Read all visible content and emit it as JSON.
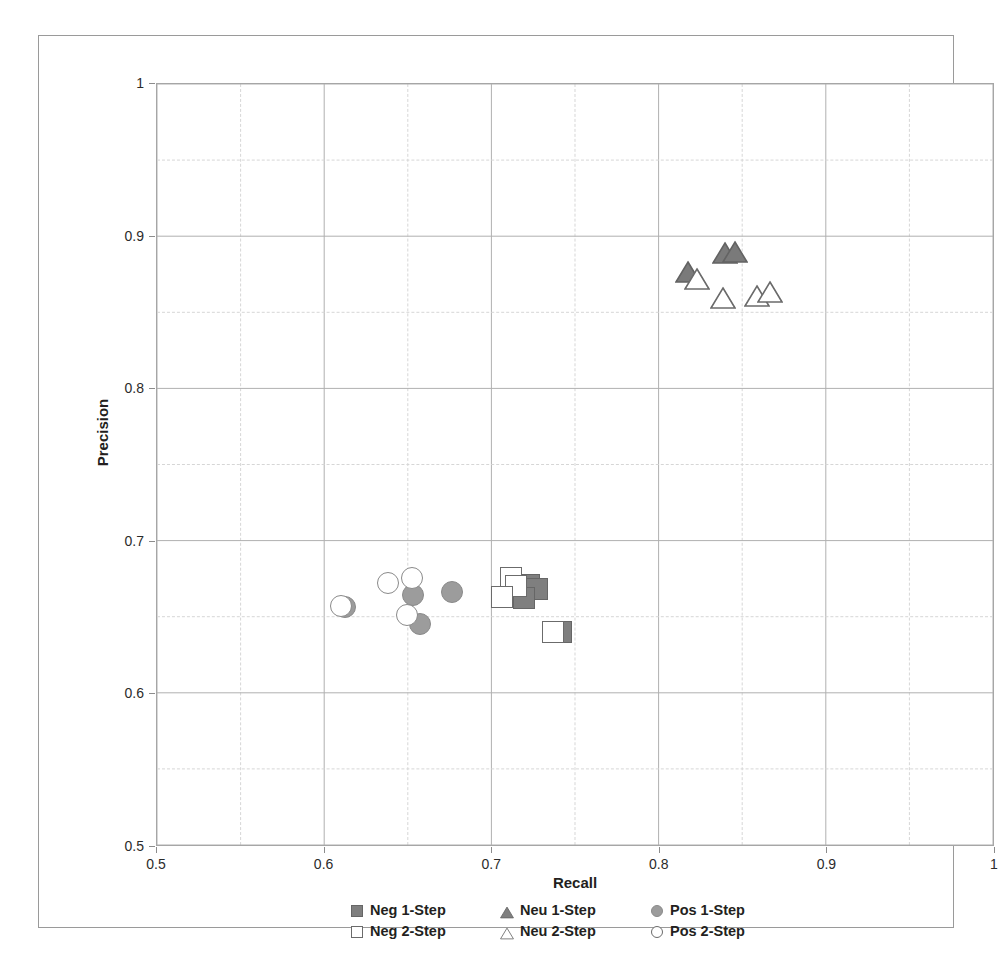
{
  "axes": {
    "x_title": "Recall",
    "y_title": "Precision",
    "x_ticks": [
      "0.5",
      "0.6",
      "0.7",
      "0.8",
      "0.9",
      "1"
    ],
    "y_ticks": [
      "0.5",
      "0.6",
      "0.7",
      "0.8",
      "0.9",
      "1"
    ]
  },
  "legend": {
    "rows": [
      [
        {
          "label": "Neg 1-Step",
          "marker": "square-filled",
          "color": "#7f7f7f"
        },
        {
          "label": "Neu 1-Step",
          "marker": "triangle-filled",
          "color": "#7f7f7f"
        },
        {
          "label": "Pos 1-Step",
          "marker": "circle-filled",
          "color": "#9c9c9c"
        }
      ],
      [
        {
          "label": "Neg 2-Step",
          "marker": "square-hollow",
          "color": "#ffffff"
        },
        {
          "label": "Neu 2-Step",
          "marker": "triangle-hollow",
          "color": "#ffffff"
        },
        {
          "label": "Pos 2-Step",
          "marker": "circle-hollow",
          "color": "#ffffff"
        }
      ]
    ]
  },
  "bleed_text": {
    "line1": "",
    "line2": ""
  },
  "chart_data": {
    "type": "scatter",
    "title": "",
    "xlabel": "Recall",
    "ylabel": "Precision",
    "xlim": [
      0.5,
      1.0
    ],
    "ylim": [
      0.5,
      1.0
    ],
    "xtick_step": 0.1,
    "ytick_step": 0.1,
    "minor_grid_step": 0.05,
    "grid": true,
    "legend_position": "bottom",
    "series": [
      {
        "name": "Neg 1-Step",
        "marker": "square",
        "fill": "#7f7f7f",
        "stroke": "#666666",
        "points": [
          {
            "x": 0.722,
            "y": 0.672
          },
          {
            "x": 0.727,
            "y": 0.669
          },
          {
            "x": 0.719,
            "y": 0.663
          },
          {
            "x": 0.741,
            "y": 0.641
          }
        ]
      },
      {
        "name": "Neu 1-Step",
        "marker": "triangle",
        "fill": "#7a7a7a",
        "stroke": "#636363",
        "points": [
          {
            "x": 0.817,
            "y": 0.877
          },
          {
            "x": 0.839,
            "y": 0.889
          },
          {
            "x": 0.845,
            "y": 0.89
          }
        ]
      },
      {
        "name": "Pos 1-Step",
        "marker": "circle",
        "fill": "#9c9c9c",
        "stroke": "#8a8a8a",
        "points": [
          {
            "x": 0.612,
            "y": 0.657
          },
          {
            "x": 0.653,
            "y": 0.665
          },
          {
            "x": 0.657,
            "y": 0.646
          },
          {
            "x": 0.676,
            "y": 0.667
          }
        ]
      },
      {
        "name": "Neg 2-Step",
        "marker": "square",
        "fill": "#ffffff",
        "stroke": "#6b6b6b",
        "points": [
          {
            "x": 0.711,
            "y": 0.676
          },
          {
            "x": 0.714,
            "y": 0.671
          },
          {
            "x": 0.706,
            "y": 0.664
          },
          {
            "x": 0.736,
            "y": 0.641
          }
        ]
      },
      {
        "name": "Neu 2-Step",
        "marker": "triangle",
        "fill": "#ffffff",
        "stroke": "#6b6b6b",
        "points": [
          {
            "x": 0.822,
            "y": 0.872
          },
          {
            "x": 0.838,
            "y": 0.86
          },
          {
            "x": 0.858,
            "y": 0.861
          },
          {
            "x": 0.866,
            "y": 0.864
          }
        ]
      },
      {
        "name": "Pos 2-Step",
        "marker": "circle",
        "fill": "#ffffff",
        "stroke": "#8a8a8a",
        "points": [
          {
            "x": 0.61,
            "y": 0.658
          },
          {
            "x": 0.638,
            "y": 0.673
          },
          {
            "x": 0.649,
            "y": 0.652
          },
          {
            "x": 0.652,
            "y": 0.676
          }
        ]
      }
    ]
  }
}
